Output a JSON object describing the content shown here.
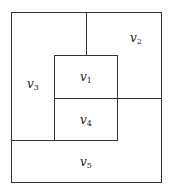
{
  "diagram": {
    "type": "rectangular-dual-partition",
    "regions": [
      {
        "id": "v1",
        "base": "v",
        "sub": "1"
      },
      {
        "id": "v2",
        "base": "v",
        "sub": "2"
      },
      {
        "id": "v3",
        "base": "v",
        "sub": "3"
      },
      {
        "id": "v4",
        "base": "v",
        "sub": "4"
      },
      {
        "id": "v5",
        "base": "v",
        "sub": "5"
      }
    ]
  }
}
